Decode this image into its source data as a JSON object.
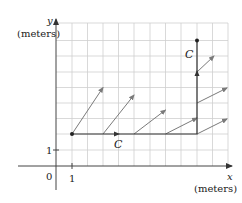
{
  "diagram": {
    "type": "vector-field-with-path",
    "axes": {
      "x_label": "x",
      "x_unit": "(meters)",
      "y_label": "y",
      "y_unit": "(meters)",
      "origin_label": "0",
      "x_tick_label": "1",
      "y_tick_label": "1"
    },
    "grid": {
      "cols": 11,
      "rows": 9,
      "cell_px": 15.6
    },
    "curve": {
      "label_horizontal": "C",
      "label_vertical": "C",
      "points": [
        [
          1,
          2
        ],
        [
          9,
          2
        ],
        [
          9,
          8
        ]
      ]
    },
    "vectors": [
      {
        "from": [
          1,
          2
        ],
        "to": [
          3,
          5
        ]
      },
      {
        "from": [
          3,
          2
        ],
        "to": [
          5,
          4.5
        ]
      },
      {
        "from": [
          5,
          2
        ],
        "to": [
          7,
          3.5
        ]
      },
      {
        "from": [
          7,
          2
        ],
        "to": [
          9,
          3
        ]
      },
      {
        "from": [
          9,
          2
        ],
        "to": [
          11,
          3
        ]
      },
      {
        "from": [
          9,
          4
        ],
        "to": [
          11,
          5
        ]
      },
      {
        "from": [
          9,
          6
        ],
        "to": [
          10.1,
          7
        ]
      }
    ],
    "colors": {
      "grid": "#cfcfcf",
      "axes": "#444444",
      "curve": "#333333",
      "vector": "#7a7a7a"
    }
  }
}
